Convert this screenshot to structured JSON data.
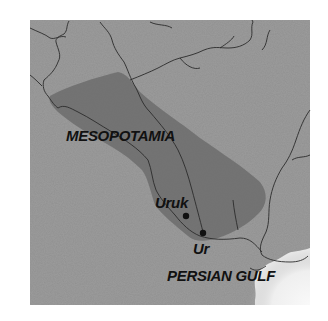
{
  "map": {
    "region_label": "MESOPOTAMIA",
    "cities": [
      {
        "name": "Uruk"
      },
      {
        "name": "Ur"
      }
    ],
    "water_label": "PERSIAN GULF",
    "colors": {
      "land": "#9a9a9a",
      "region_shade": "#6e6e6e",
      "rivers": "#2a2a2a",
      "gulf": "#e8e8e8",
      "background": "#ffffff"
    }
  }
}
